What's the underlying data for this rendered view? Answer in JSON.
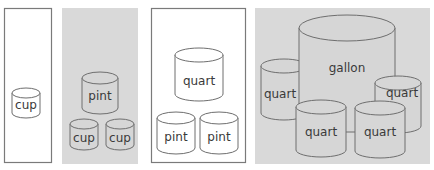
{
  "colors": {
    "background": "#ffffff",
    "gray_panel": "#d9d9d9",
    "outline": "#6e6e6e",
    "cylinder_fill_white": "#ffffff",
    "cylinder_fill_gray": "#d6d6d6",
    "label": "#3a3a3a"
  },
  "panels": [
    {
      "name": "cup-panel",
      "style": "outlined-white",
      "containers": [
        {
          "label": "cup"
        }
      ]
    },
    {
      "name": "cups-equal-pint-panel",
      "style": "gray",
      "containers": [
        {
          "label": "pint"
        },
        {
          "label": "cup"
        },
        {
          "label": "cup"
        }
      ]
    },
    {
      "name": "pints-equal-quart-panel",
      "style": "outlined-white",
      "containers": [
        {
          "label": "quart"
        },
        {
          "label": "pint"
        },
        {
          "label": "pint"
        }
      ]
    },
    {
      "name": "quarts-equal-gallon-panel",
      "style": "gray",
      "containers": [
        {
          "label": "gallon"
        },
        {
          "label": "quart"
        },
        {
          "label": "quart"
        },
        {
          "label": "quart"
        },
        {
          "label": "quart"
        }
      ]
    }
  ]
}
